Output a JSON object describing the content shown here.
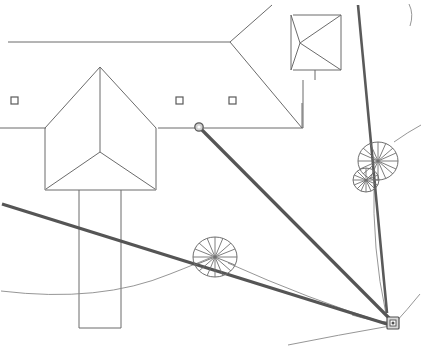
{
  "drawing": {
    "title": "Site Survey Plan",
    "type": "cad-site-plan",
    "width": 421,
    "height": 353,
    "background_color": "#ffffff",
    "line_color": "#6b6b6b",
    "heavy_line_color": "#555555",
    "accent_color": "#8a8a8a",
    "labels": {
      "roof_plan": "Main building roof plan",
      "pavilion": "Hip roof pavilion",
      "annex": "Rectangular annex",
      "station": "Survey station",
      "node": "Measurement node",
      "trees": "Tree canopy symbols",
      "path": "Site path / contour"
    }
  },
  "elements": {
    "main_roof": {
      "name": "main-roof-plan",
      "ridge_line": "M 8 42 L 230 42",
      "hip_right_up": "M 230 42 L 272 5",
      "hip_right_down": "M 230 42 L 302 128",
      "eave_right": "M 302 128 L 302 103",
      "eave_bottom": "M 160 128 L 302 128",
      "eave_left": "M 8 128 L 45 128"
    },
    "house": {
      "name": "house-roof",
      "ridge_vertical": "M 100 67 L 100 152",
      "hip_left_up": "M 100 67 L 45 127",
      "hip_right_up": "M 100 67 L 155 127",
      "wall_left": "M 45 127 L 45 190",
      "wall_right": "M 155 127 L 155 190",
      "wall_bottom": "M 45 190 L 155 190",
      "hip_left_down": "M 100 152 L 46 189",
      "hip_right_down": "M 100 152 L 154 189"
    },
    "annex": {
      "name": "annex-block",
      "left": "M 78 190 L 78 327",
      "right": "M 120 190 L 120 327",
      "bottom": "M 78 327 L 120 327"
    },
    "pavilion": {
      "name": "pavilion-roof",
      "top_edge": "M 292 16 L 340 16",
      "right_edge": "M 340 16 L 340 70",
      "bottom_edge": "M 292 70 L 340 70",
      "hip_upper": "M 340 16 L 300 43",
      "hip_lower": "M 340 70 L 300 43",
      "apex_left_up": "M 300 43 L 292 16",
      "apex_left_down": "M 300 43 L 292 70",
      "foot": "M 314 70 L 314 79"
    },
    "markers": [
      {
        "name": "square-marker-1",
        "x": 14,
        "y": 100,
        "size": 7
      },
      {
        "name": "square-marker-2",
        "x": 179,
        "y": 100,
        "size": 7
      },
      {
        "name": "square-marker-3",
        "x": 232,
        "y": 100,
        "size": 7
      }
    ],
    "node": {
      "name": "measurement-node",
      "x": 199,
      "y": 127,
      "r": 4
    },
    "station": {
      "name": "survey-station",
      "x": 393,
      "y": 323,
      "size": 11
    },
    "trees": [
      {
        "name": "tree-canopy-upper-right",
        "cx": 378,
        "cy": 161,
        "rx": 20,
        "ry": 19,
        "spokes": 16
      },
      {
        "name": "tree-canopy-lower-right",
        "cx": 366,
        "cy": 180,
        "rx": 13,
        "ry": 12,
        "spokes": 14
      },
      {
        "name": "tree-canopy-center",
        "cx": 215,
        "cy": 257,
        "rx": 22,
        "ry": 20,
        "spokes": 16
      }
    ],
    "sight_lines": [
      {
        "name": "sight-line-node-to-station",
        "d": "M 201 129 L 392 322"
      },
      {
        "name": "sight-line-tree-to-station",
        "d": "M 358 6 L 386 314"
      },
      {
        "name": "sight-line-left-to-station",
        "d": "M 4 205 L 390 325"
      }
    ],
    "paths": [
      {
        "name": "path-left-curve",
        "d": "M 2 292 Q 110 305 196 268 T 214 258"
      },
      {
        "name": "path-tree-to-station",
        "d": "M 226 262 Q 310 300 386 326"
      },
      {
        "name": "path-station-branch-low",
        "d": "M 289 344 Q 340 334 389 326"
      },
      {
        "name": "path-station-branch-right",
        "d": "M 394 324 Q 407 311 419 295"
      },
      {
        "name": "path-tree-upper-right",
        "d": "M 396 140 Q 410 131 421 126"
      },
      {
        "name": "path-tree-link",
        "d": "M 383 175 Q 381 250 388 315"
      },
      {
        "name": "path-corner-tick",
        "d": "M 409 4 Q 413 15 410 26"
      }
    ]
  }
}
